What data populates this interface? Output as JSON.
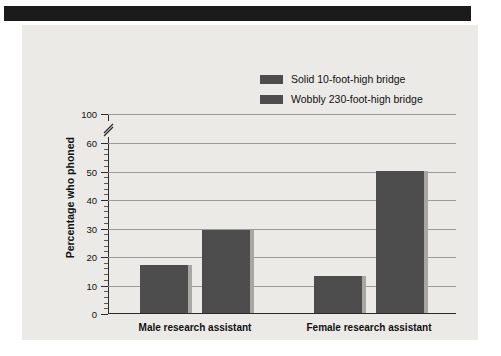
{
  "figure": {
    "background": "#eceae6",
    "header_bar_color": "#1b1b1b",
    "bar_color": "#4d4d4d",
    "gridline_color": "#9a9a9a",
    "axis_color": "#2a2a2a"
  },
  "legend": {
    "position": "top-center-right",
    "entries": [
      {
        "label": "Solid 10-foot-high bridge",
        "color": "#4d4d4d"
      },
      {
        "label": "Wobbly 230-foot-high bridge",
        "color": "#4d4d4d"
      }
    ]
  },
  "chart_data": {
    "type": "bar",
    "title": "",
    "xlabel": "",
    "ylabel": "Percentage who phoned",
    "categories": [
      "Male research assistant",
      "Female research assistant"
    ],
    "series": [
      {
        "name": "Solid 10-foot-high bridge",
        "values": [
          17,
          13
        ]
      },
      {
        "name": "Wobbly 230-foot-high bridge",
        "values": [
          29,
          50
        ]
      }
    ],
    "ylim": [
      0,
      100
    ],
    "axis_break": {
      "between": [
        60,
        100
      ],
      "symbol": "//"
    },
    "ytick_labels": [
      "0",
      "10",
      "20",
      "30",
      "40",
      "50",
      "60",
      "100"
    ],
    "ytick_values": [
      0,
      10,
      20,
      30,
      40,
      50,
      60,
      100
    ],
    "minor_tick_step": 2,
    "grid": true,
    "grid_axis": "y",
    "legend_position": "top"
  }
}
